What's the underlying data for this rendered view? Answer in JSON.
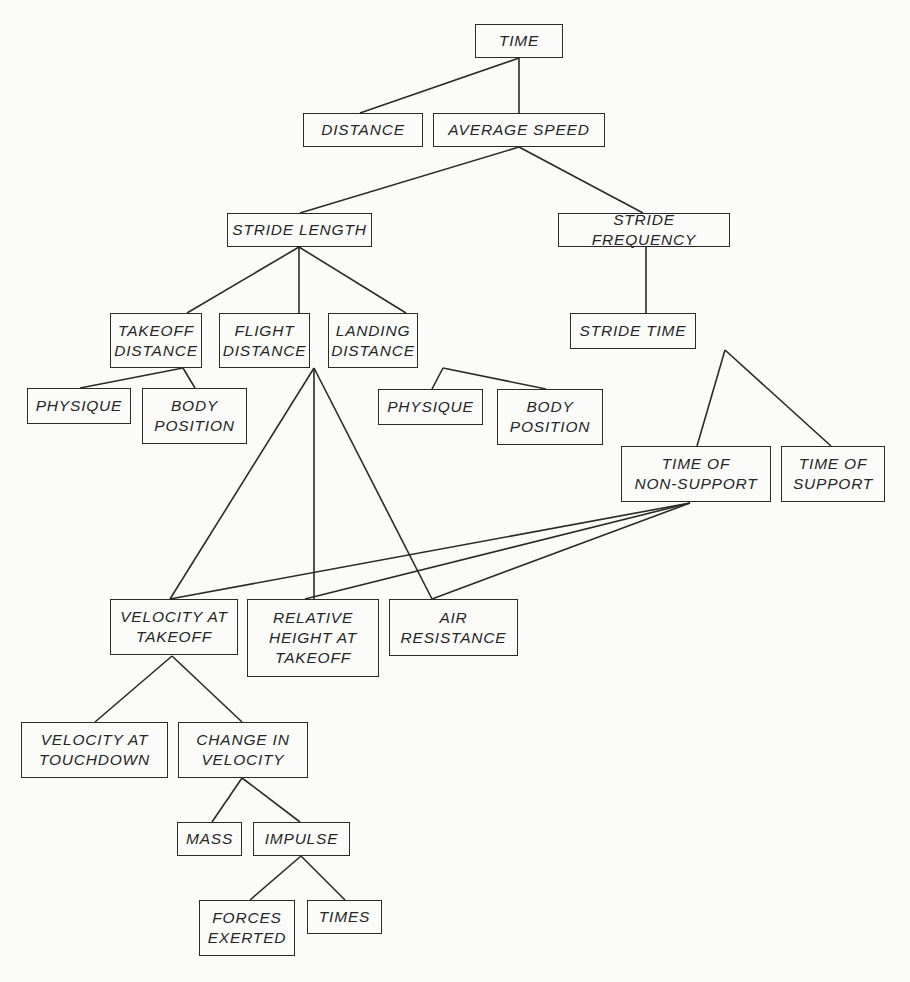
{
  "diagram": {
    "type": "hierarchical-tree",
    "nodes": [
      {
        "id": "time",
        "label": "TIME",
        "x": 475,
        "y": 24,
        "w": 88,
        "h": 34
      },
      {
        "id": "distance",
        "label": "DISTANCE",
        "x": 303,
        "y": 113,
        "w": 120,
        "h": 34
      },
      {
        "id": "average_speed",
        "label": "AVERAGE SPEED",
        "x": 433,
        "y": 113,
        "w": 172,
        "h": 34
      },
      {
        "id": "stride_length",
        "label": "STRIDE LENGTH",
        "x": 227,
        "y": 213,
        "w": 145,
        "h": 34
      },
      {
        "id": "stride_frequency",
        "label": "STRIDE FREQUENCY",
        "x": 558,
        "y": 213,
        "w": 172,
        "h": 34
      },
      {
        "id": "takeoff_distance",
        "label": "TAKEOFF\nDISTANCE",
        "x": 110,
        "y": 313,
        "w": 92,
        "h": 55
      },
      {
        "id": "flight_distance",
        "label": "FLIGHT\nDISTANCE",
        "x": 219,
        "y": 313,
        "w": 91,
        "h": 55
      },
      {
        "id": "landing_distance",
        "label": "LANDING\nDISTANCE",
        "x": 328,
        "y": 313,
        "w": 90,
        "h": 55
      },
      {
        "id": "stride_time",
        "label": "STRIDE TIME",
        "x": 570,
        "y": 313,
        "w": 126,
        "h": 36
      },
      {
        "id": "physique_1",
        "label": "PHYSIQUE",
        "x": 27,
        "y": 388,
        "w": 104,
        "h": 36
      },
      {
        "id": "body_position_1",
        "label": "BODY\nPOSITION",
        "x": 142,
        "y": 388,
        "w": 105,
        "h": 56
      },
      {
        "id": "physique_2",
        "label": "PHYSIQUE",
        "x": 378,
        "y": 389,
        "w": 105,
        "h": 36
      },
      {
        "id": "body_position_2",
        "label": "BODY\nPOSITION",
        "x": 497,
        "y": 389,
        "w": 106,
        "h": 56
      },
      {
        "id": "time_of_non_support",
        "label": "TIME OF\nNON-SUPPORT",
        "x": 621,
        "y": 446,
        "w": 150,
        "h": 56
      },
      {
        "id": "time_of_support",
        "label": "TIME OF\nSUPPORT",
        "x": 781,
        "y": 446,
        "w": 104,
        "h": 56
      },
      {
        "id": "velocity_at_takeoff",
        "label": "VELOCITY AT\nTAKEOFF",
        "x": 110,
        "y": 599,
        "w": 128,
        "h": 56
      },
      {
        "id": "relative_height_at_takeoff",
        "label": "RELATIVE\nHEIGHT AT\nTAKEOFF",
        "x": 247,
        "y": 599,
        "w": 132,
        "h": 78
      },
      {
        "id": "air_resistance",
        "label": "AIR\nRESISTANCE",
        "x": 389,
        "y": 599,
        "w": 129,
        "h": 57
      },
      {
        "id": "velocity_at_touchdown",
        "label": "VELOCITY AT\nTOUCHDOWN",
        "x": 21,
        "y": 722,
        "w": 147,
        "h": 56
      },
      {
        "id": "change_in_velocity",
        "label": "CHANGE IN\nVELOCITY",
        "x": 178,
        "y": 722,
        "w": 130,
        "h": 56
      },
      {
        "id": "mass",
        "label": "MASS",
        "x": 177,
        "y": 822,
        "w": 65,
        "h": 34
      },
      {
        "id": "impulse",
        "label": "IMPULSE",
        "x": 253,
        "y": 822,
        "w": 97,
        "h": 34
      },
      {
        "id": "forces_exerted",
        "label": "FORCES\nEXERTED",
        "x": 199,
        "y": 900,
        "w": 96,
        "h": 56
      },
      {
        "id": "times",
        "label": "TIMES",
        "x": 307,
        "y": 900,
        "w": 75,
        "h": 34
      }
    ],
    "edges": [
      {
        "from": "time",
        "to": "distance",
        "x1": 519,
        "y1": 58,
        "x2": 360,
        "y2": 113
      },
      {
        "from": "time",
        "to": "average_speed",
        "x1": 519,
        "y1": 58,
        "x2": 519,
        "y2": 113
      },
      {
        "from": "average_speed",
        "to": "stride_length",
        "x1": 519,
        "y1": 147,
        "x2": 300,
        "y2": 213
      },
      {
        "from": "average_speed",
        "to": "stride_frequency",
        "x1": 519,
        "y1": 147,
        "x2": 643,
        "y2": 213
      },
      {
        "from": "stride_length",
        "to": "takeoff_distance",
        "x1": 299,
        "y1": 247,
        "x2": 187,
        "y2": 313
      },
      {
        "from": "stride_length",
        "to": "flight_distance",
        "x1": 299,
        "y1": 247,
        "x2": 299,
        "y2": 313
      },
      {
        "from": "stride_length",
        "to": "landing_distance",
        "x1": 299,
        "y1": 247,
        "x2": 406,
        "y2": 313
      },
      {
        "from": "stride_frequency",
        "to": "stride_time",
        "x1": 646,
        "y1": 247,
        "x2": 646,
        "y2": 313
      },
      {
        "from": "takeoff_distance",
        "to": "physique_1",
        "x1": 183,
        "y1": 368,
        "x2": 80,
        "y2": 388
      },
      {
        "from": "takeoff_distance",
        "to": "body_position_1",
        "x1": 183,
        "y1": 368,
        "x2": 195,
        "y2": 388
      },
      {
        "from": "landing_distance",
        "to": "physique_2",
        "x1": 443,
        "y1": 368,
        "x2": 432,
        "y2": 389
      },
      {
        "from": "landing_distance",
        "to": "body_position_2",
        "x1": 443,
        "y1": 368,
        "x2": 546,
        "y2": 389
      },
      {
        "from": "stride_time",
        "to": "time_of_non_support",
        "x1": 725,
        "y1": 350,
        "x2": 697,
        "y2": 446
      },
      {
        "from": "stride_time",
        "to": "time_of_support",
        "x1": 725,
        "y1": 350,
        "x2": 831,
        "y2": 446
      },
      {
        "from": "flight_distance",
        "to": "velocity_at_takeoff",
        "x1": 314,
        "y1": 368,
        "x2": 170,
        "y2": 599
      },
      {
        "from": "flight_distance",
        "to": "relative_height_at_takeoff",
        "x1": 314,
        "y1": 368,
        "x2": 314,
        "y2": 599
      },
      {
        "from": "flight_distance",
        "to": "air_resistance",
        "x1": 314,
        "y1": 368,
        "x2": 432,
        "y2": 599
      },
      {
        "from": "time_of_non_support",
        "to": "velocity_at_takeoff",
        "x1": 690,
        "y1": 503,
        "x2": 170,
        "y2": 599
      },
      {
        "from": "time_of_non_support",
        "to": "relative_height_at_takeoff",
        "x1": 690,
        "y1": 503,
        "x2": 305,
        "y2": 599
      },
      {
        "from": "time_of_non_support",
        "to": "air_resistance",
        "x1": 690,
        "y1": 503,
        "x2": 432,
        "y2": 599
      },
      {
        "from": "velocity_at_takeoff",
        "to": "velocity_at_touchdown",
        "x1": 172,
        "y1": 656,
        "x2": 95,
        "y2": 722
      },
      {
        "from": "velocity_at_takeoff",
        "to": "change_in_velocity",
        "x1": 172,
        "y1": 656,
        "x2": 242,
        "y2": 722
      },
      {
        "from": "change_in_velocity",
        "to": "mass",
        "x1": 242,
        "y1": 778,
        "x2": 212,
        "y2": 822
      },
      {
        "from": "change_in_velocity",
        "to": "impulse",
        "x1": 242,
        "y1": 778,
        "x2": 300,
        "y2": 822
      },
      {
        "from": "impulse",
        "to": "forces_exerted",
        "x1": 301,
        "y1": 856,
        "x2": 250,
        "y2": 900
      },
      {
        "from": "impulse",
        "to": "times",
        "x1": 301,
        "y1": 856,
        "x2": 345,
        "y2": 900
      }
    ]
  }
}
